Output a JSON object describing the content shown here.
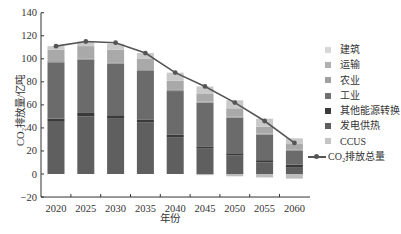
{
  "chart_data": {
    "type": "bar",
    "stacked": true,
    "title": "",
    "xlabel": "年份",
    "ylabel": "CO₂排放量/亿吨",
    "ylim": [
      -20,
      140
    ],
    "yticks": [
      -20,
      0,
      20,
      40,
      60,
      80,
      100,
      120,
      140
    ],
    "categories": [
      "2020",
      "2025",
      "2030",
      "2035",
      "2040",
      "2045",
      "2050",
      "2055",
      "2060"
    ],
    "legend_position": "right",
    "grid": false,
    "series": [
      {
        "name": "发电供热",
        "color": "#5f5f5f",
        "values": [
          46,
          50,
          48,
          45,
          32,
          22,
          16,
          10,
          6
        ]
      },
      {
        "name": "其他能源转换",
        "color": "#3a3a3a",
        "values": [
          2,
          3,
          3,
          2,
          2,
          2,
          2,
          2,
          2
        ]
      },
      {
        "name": "工业",
        "color": "#6b6b6b",
        "values": [
          49,
          46,
          45,
          43,
          38,
          38,
          31,
          22,
          12
        ]
      },
      {
        "name": "农业",
        "color": "#9a9a9a",
        "values": [
          1,
          1,
          1,
          1,
          1,
          1,
          1,
          1,
          1
        ]
      },
      {
        "name": "运输",
        "color": "#a9a9a9",
        "values": [
          10,
          11,
          11,
          9,
          8,
          7,
          7,
          6,
          5
        ]
      },
      {
        "name": "建筑",
        "color": "#c9c9c9",
        "values": [
          3,
          4,
          5,
          5,
          7,
          6,
          7,
          7,
          5
        ]
      },
      {
        "name": "CCUS",
        "color": "#bdbdbd",
        "values": [
          0,
          0,
          0,
          0,
          0,
          -1,
          -2,
          -3,
          -4
        ]
      }
    ],
    "line": {
      "name": "CO₂排放总量",
      "color": "#555555",
      "values": [
        111,
        115,
        114,
        105,
        88,
        76,
        62,
        46,
        27
      ]
    }
  },
  "legend": {
    "items": [
      {
        "label": "建筑",
        "color": "#d6d6d6"
      },
      {
        "label": "运输",
        "color": "#b0b0b0"
      },
      {
        "label": "农业",
        "color": "#a0a0a0"
      },
      {
        "label": "工业",
        "color": "#707070"
      },
      {
        "label": "其他能源转换",
        "color": "#3a3a3a"
      },
      {
        "label": "发电供热",
        "color": "#5f5f5f"
      },
      {
        "label": "CCUS",
        "color": "#c4c4c4"
      }
    ],
    "line_label": "CO₂排放总量"
  },
  "axis": {
    "ylabel": "CO₂排放量/亿吨",
    "xlabel": "年份"
  }
}
